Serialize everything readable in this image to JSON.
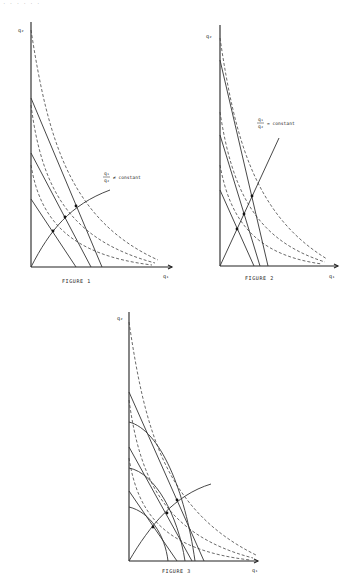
{
  "header": {
    "text": "· ·  · ·      · ·"
  },
  "figures": [
    {
      "caption": "FIGURE 1",
      "y_axis_label": "q₂",
      "x_axis_label": "q₁",
      "annotation": {
        "numerator": "q₁",
        "denominator": "q₂",
        "relation": "≠ constant"
      }
    },
    {
      "caption": "FIGURE 2",
      "y_axis_label": "q₂",
      "x_axis_label": "q₁",
      "annotation": {
        "numerator": "q₁",
        "denominator": "q₂",
        "relation": "= constant"
      }
    },
    {
      "caption": "FIGURE 3",
      "y_axis_label": "q₂",
      "x_axis_label": "q₁"
    }
  ]
}
